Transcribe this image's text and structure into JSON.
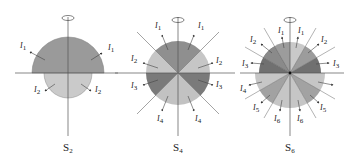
{
  "colors": {
    "dark": "#7d7d7d",
    "mid": "#9e9e9e",
    "light": "#c8c8c8",
    "line": "#555555",
    "text": "#222222"
  },
  "panels": [
    {
      "id": "S2",
      "caption": "S",
      "caption_sub": "2",
      "labels": [
        {
          "text": "I",
          "sub": "1"
        },
        {
          "text": "I",
          "sub": "1"
        },
        {
          "text": "I",
          "sub": "2"
        },
        {
          "text": "I",
          "sub": "2"
        }
      ]
    },
    {
      "id": "S4",
      "caption": "S",
      "caption_sub": "4",
      "labels": [
        {
          "text": "I",
          "sub": "1"
        },
        {
          "text": "I",
          "sub": "1"
        },
        {
          "text": "I",
          "sub": "2"
        },
        {
          "text": "I",
          "sub": "2"
        },
        {
          "text": "I",
          "sub": "3"
        },
        {
          "text": "I",
          "sub": "3"
        },
        {
          "text": "I",
          "sub": "4"
        },
        {
          "text": "I",
          "sub": "4"
        }
      ]
    },
    {
      "id": "S6",
      "caption": "S",
      "caption_sub": "6",
      "labels": [
        {
          "text": "I",
          "sub": "1"
        },
        {
          "text": "I",
          "sub": "1"
        },
        {
          "text": "I",
          "sub": "2"
        },
        {
          "text": "I",
          "sub": "2"
        },
        {
          "text": "I",
          "sub": "3"
        },
        {
          "text": "I",
          "sub": "3"
        },
        {
          "text": "I",
          "sub": "4"
        },
        {
          "text": "I",
          "sub": "5"
        },
        {
          "text": "I",
          "sub": "5"
        },
        {
          "text": "I",
          "sub": "6"
        },
        {
          "text": "I",
          "sub": "6"
        }
      ]
    }
  ]
}
